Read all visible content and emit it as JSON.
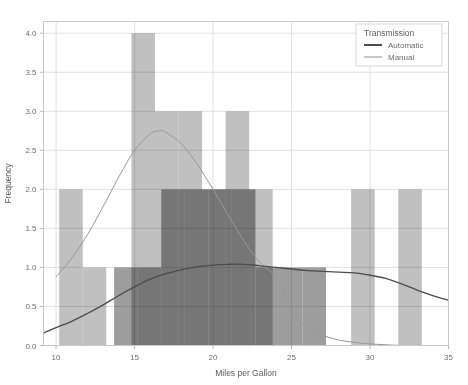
{
  "chart_data": {
    "type": "bar",
    "title": "",
    "xlabel": "Miles per Gallon",
    "ylabel": "Frequency",
    "xlim": [
      9.2,
      35.0
    ],
    "ylim": [
      0.0,
      4.15
    ],
    "xticks": [
      10,
      15,
      20,
      25,
      30,
      35
    ],
    "xtick_labels": [
      "10",
      "15",
      "20",
      "25",
      "30",
      "35"
    ],
    "yticks": [
      0.0,
      0.5,
      1.0,
      1.5,
      2.0,
      2.5,
      3.0,
      3.5,
      4.0
    ],
    "ytick_labels": [
      "0.0",
      "0.5",
      "1.0",
      "1.5",
      "2.0",
      "2.5",
      "3.0",
      "3.5",
      "4.0"
    ],
    "grid": true,
    "legend_position": "top-right",
    "bin_width": 1.5,
    "overlap_mode": "overlay",
    "series": [
      {
        "name": "Automatic",
        "color": "#8c8c8c",
        "curve_color": "#4d4d4d",
        "bins": [
          {
            "x0": 13.7,
            "x1": 15.2,
            "value": 1
          },
          {
            "x0": 15.2,
            "x1": 16.7,
            "value": 1
          },
          {
            "x0": 16.7,
            "x1": 18.2,
            "value": 2
          },
          {
            "x0": 18.2,
            "x1": 19.7,
            "value": 2
          },
          {
            "x0": 19.7,
            "x1": 21.2,
            "value": 2
          },
          {
            "x0": 21.2,
            "x1": 22.7,
            "value": 2
          },
          {
            "x0": 22.7,
            "x1": 24.2,
            "value": 1
          },
          {
            "x0": 24.2,
            "x1": 25.7,
            "value": 1
          },
          {
            "x0": 25.7,
            "x1": 27.2,
            "value": 1
          }
        ],
        "kde": [
          [
            9.2,
            0.16
          ],
          [
            10.0,
            0.23
          ],
          [
            11.0,
            0.31
          ],
          [
            12.0,
            0.41
          ],
          [
            13.0,
            0.52
          ],
          [
            14.0,
            0.64
          ],
          [
            15.0,
            0.75
          ],
          [
            16.0,
            0.85
          ],
          [
            17.0,
            0.92
          ],
          [
            18.0,
            0.97
          ],
          [
            19.0,
            1.01
          ],
          [
            20.0,
            1.03
          ],
          [
            21.0,
            1.04
          ],
          [
            22.0,
            1.04
          ],
          [
            23.0,
            1.02
          ],
          [
            24.0,
            1.0
          ],
          [
            25.0,
            0.98
          ],
          [
            26.0,
            0.96
          ],
          [
            27.0,
            0.95
          ],
          [
            28.0,
            0.94
          ],
          [
            29.0,
            0.93
          ],
          [
            30.0,
            0.9
          ],
          [
            31.0,
            0.86
          ],
          [
            32.0,
            0.79
          ],
          [
            33.0,
            0.71
          ],
          [
            34.0,
            0.64
          ],
          [
            35.0,
            0.58
          ]
        ]
      },
      {
        "name": "Manual",
        "color": "#b5b5b5",
        "curve_color": "#989898",
        "bins": [
          {
            "x0": 10.2,
            "x1": 11.7,
            "value": 2
          },
          {
            "x0": 11.7,
            "x1": 13.2,
            "value": 1
          },
          {
            "x0": 14.8,
            "x1": 16.3,
            "value": 4
          },
          {
            "x0": 16.3,
            "x1": 17.8,
            "value": 3
          },
          {
            "x0": 17.8,
            "x1": 19.3,
            "value": 3
          },
          {
            "x0": 19.3,
            "x1": 20.8,
            "value": 2
          },
          {
            "x0": 20.8,
            "x1": 22.3,
            "value": 3
          },
          {
            "x0": 22.3,
            "x1": 23.8,
            "value": 2
          },
          {
            "x0": 28.8,
            "x1": 30.3,
            "value": 2
          },
          {
            "x0": 31.8,
            "x1": 33.3,
            "value": 2
          }
        ],
        "kde": [
          [
            10.0,
            0.88
          ],
          [
            11.0,
            1.12
          ],
          [
            12.0,
            1.42
          ],
          [
            13.0,
            1.78
          ],
          [
            14.0,
            2.16
          ],
          [
            15.0,
            2.5
          ],
          [
            16.0,
            2.71
          ],
          [
            16.6,
            2.75
          ],
          [
            17.0,
            2.73
          ],
          [
            18.0,
            2.58
          ],
          [
            19.0,
            2.32
          ],
          [
            20.0,
            2.0
          ],
          [
            21.0,
            1.66
          ],
          [
            22.0,
            1.33
          ],
          [
            23.0,
            1.06
          ],
          [
            24.0,
            0.88
          ],
          [
            24.6,
            0.62
          ],
          [
            25.0,
            0.4
          ],
          [
            26.0,
            0.22
          ],
          [
            27.0,
            0.13
          ],
          [
            28.0,
            0.07
          ],
          [
            29.0,
            0.04
          ],
          [
            30.0,
            0.02
          ],
          [
            31.0,
            0.01
          ],
          [
            32.0,
            0.0
          ],
          [
            33.0,
            0.0
          ],
          [
            34.0,
            0.0
          ]
        ]
      }
    ]
  },
  "legend": {
    "title": "Transmission",
    "entries": [
      {
        "label": "Automatic",
        "swatch_color": "#4d4d4d"
      },
      {
        "label": "Manual",
        "swatch_color": "#989898"
      }
    ]
  },
  "style": {
    "background": "#ffffff",
    "grid_color": "#dedede",
    "frame_color": "#c9c9c9",
    "tick_text_color": "#6e6e6e",
    "axis_title_color": "#5a5a5a"
  }
}
